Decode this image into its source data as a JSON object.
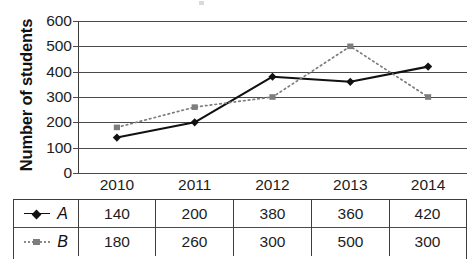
{
  "chart_data": {
    "type": "line",
    "title": "",
    "xlabel": "",
    "ylabel": "Number of students",
    "categories": [
      "2010",
      "2011",
      "2012",
      "2013",
      "2014"
    ],
    "ylim": [
      0,
      600
    ],
    "ytick_step": 100,
    "yticks": [
      "600",
      "500",
      "400",
      "300",
      "200",
      "100",
      "0"
    ],
    "grid": true,
    "legend_position": "table-below",
    "series": [
      {
        "name": "A",
        "values": [
          140,
          200,
          380,
          360,
          420
        ],
        "color": "#111111",
        "marker": "diamond",
        "linestyle": "solid"
      },
      {
        "name": "B",
        "values": [
          180,
          260,
          300,
          500,
          300
        ],
        "color": "#7d7d7d",
        "marker": "square",
        "linestyle": "dotted"
      }
    ]
  },
  "axis": {
    "y_title": "Number of students",
    "y_ticks": [
      "600",
      "500",
      "400",
      "300",
      "200",
      "100",
      "0"
    ],
    "x_ticks": [
      "2010",
      "2011",
      "2012",
      "2013",
      "2014"
    ]
  },
  "data_table": {
    "rows": [
      {
        "series_label": "A",
        "marker": "diamond-solid-line",
        "values": [
          "140",
          "200",
          "380",
          "360",
          "420"
        ]
      },
      {
        "series_label": "B",
        "marker": "square-dotted-line",
        "values": [
          "180",
          "260",
          "300",
          "500",
          "300"
        ]
      }
    ]
  },
  "colors": {
    "series_a": "#111111",
    "series_b": "#7d7d7d",
    "grid": "#4a4a4a",
    "text": "#1d1d1d"
  }
}
